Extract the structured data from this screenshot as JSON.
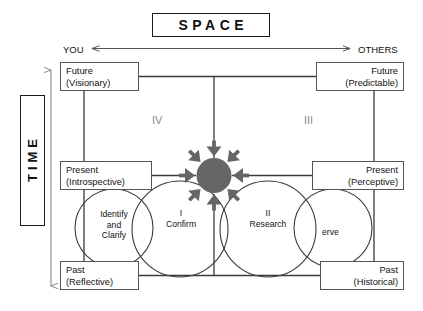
{
  "diagram": {
    "title": "SPACE",
    "vertical_axis_label": "TIME",
    "horizontal_axis": {
      "left_label": "YOU",
      "right_label": "OTHERS",
      "arrow": "double-headed"
    },
    "vertical_axis": {
      "top": "Future",
      "bottom": "Past",
      "arrow": "double-headed"
    },
    "corner_boxes": [
      {
        "id": "future-you",
        "line1": "Future",
        "line2": "(Visionary)",
        "align": "left"
      },
      {
        "id": "future-others",
        "line1": "Future",
        "line2": "(Predictable)",
        "align": "right"
      },
      {
        "id": "present-you",
        "line1": "Present",
        "line2": "(Introspective)",
        "align": "left"
      },
      {
        "id": "present-others",
        "line1": "Present",
        "line2": "(Perceptive)",
        "align": "right"
      },
      {
        "id": "past-you",
        "line1": "Past",
        "line2": "(Reflective)",
        "align": "left"
      },
      {
        "id": "past-others",
        "line1": "Past",
        "line2": "(Historical)",
        "align": "right"
      }
    ],
    "quadrants": [
      {
        "numeral": "IV",
        "position": "upper-left"
      },
      {
        "numeral": "III",
        "position": "upper-right"
      },
      {
        "numeral": "I",
        "position": "lower-left"
      },
      {
        "numeral": "II",
        "position": "lower-right"
      }
    ],
    "circles": [
      {
        "id": "identify",
        "label": "Identify\nand\nClarify",
        "type": "outer-left"
      },
      {
        "id": "confirm",
        "label": "I\nConfirm",
        "type": "inner-left"
      },
      {
        "id": "research",
        "label": "II\nResearch",
        "type": "inner-right"
      },
      {
        "id": "observe",
        "label": "erve",
        "type": "outer-right"
      }
    ],
    "center": {
      "icon": "starburst",
      "ray_count": 8,
      "fill_color": "#666666"
    },
    "colors": {
      "line": "#3a3a3a",
      "box_border": "#555555",
      "quadrant_text": "#8a8a8a",
      "burst_fill": "#666666",
      "background": "#ffffff"
    }
  }
}
